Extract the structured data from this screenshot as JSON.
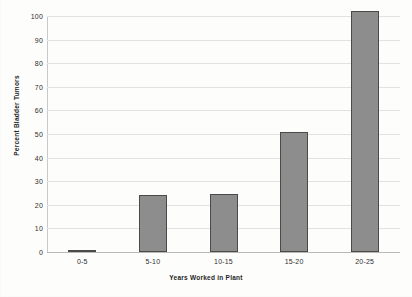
{
  "chart_data": {
    "type": "bar",
    "title": "",
    "xlabel": "Years Worked in Plant",
    "ylabel": "Percent Bladder Tumors",
    "categories": [
      "0-5",
      "5-10",
      "10-15",
      "15-20",
      "20-25"
    ],
    "values": [
      1,
      24,
      24.5,
      51,
      102
    ],
    "ylim": [
      0,
      100
    ],
    "yticks": [
      0,
      10,
      20,
      30,
      40,
      50,
      60,
      70,
      80,
      90,
      100
    ],
    "ytick_labels": [
      "0",
      "10",
      "20",
      "30",
      "40",
      "50",
      "60",
      "70",
      "80",
      "90",
      "100"
    ],
    "grid": true,
    "grid_axis": "y",
    "legend": false,
    "bar_color": "#8d8d8d",
    "bar_edge_color": "#4a4a4a",
    "gridline_color": "#e2e2e2",
    "axis_color": "#b9b9b9",
    "background_color": "#fdfdfc",
    "text_color": "#2e2e2e"
  }
}
